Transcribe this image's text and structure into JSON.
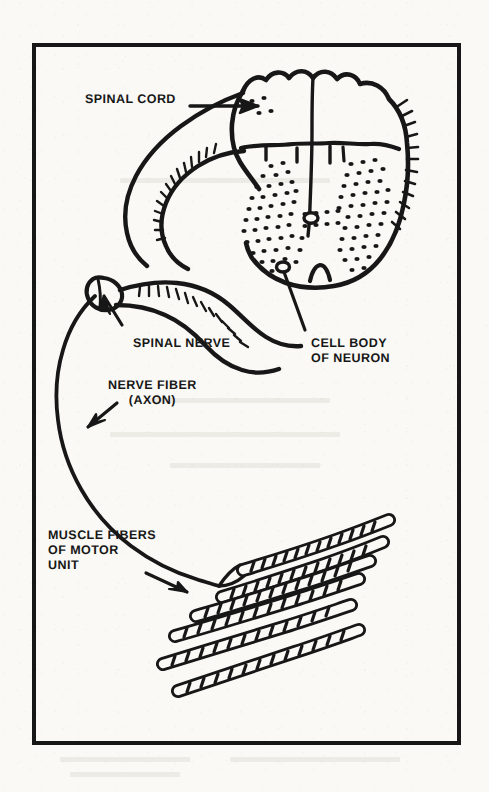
{
  "figure": {
    "background_color": "#faf9f6",
    "ink_color": "#171717",
    "frame": {
      "x": 32,
      "y": 43,
      "width": 429,
      "height": 702,
      "border_width": 4
    }
  },
  "labels": {
    "spinal_cord": {
      "text": "SPINAL CORD",
      "x": 85,
      "y": 92,
      "align": "left",
      "pointer": "arrow-right"
    },
    "spinal_nerve": {
      "text": "SPINAL NERVE",
      "x": 133,
      "y": 336,
      "align": "left",
      "pointer": "arrow-up-left"
    },
    "cell_body_of_neuron": {
      "line1": "CELL BODY",
      "line2": "OF NEURON",
      "text": "CELL BODY\nOF NEURON",
      "x": 311,
      "y": 336,
      "align": "left",
      "pointer": "leader-line-up-left"
    },
    "nerve_fiber_axon": {
      "line1": "NERVE FIBER",
      "line2": "(AXON)",
      "text": "NERVE FIBER\n(AXON)",
      "x": 108,
      "y": 378,
      "align": "center",
      "pointer": "arrow-down-left"
    },
    "muscle_fibers_of_motor_unit": {
      "line1": "MUSCLE FIBERS",
      "line2": "OF MOTOR",
      "line3": "UNIT",
      "text": "MUSCLE FIBERS\nOF MOTOR\nUNIT",
      "x": 48,
      "y": 528,
      "align": "left",
      "pointer": "arrow-down-right"
    }
  },
  "structures": [
    {
      "name": "spinal-cord-cross-section",
      "description": "Oval cross-section of spinal cord, upper right of frame"
    },
    {
      "name": "gray-matter-butterfly",
      "description": "Stippled butterfly/H-shaped gray matter inside the cord"
    },
    {
      "name": "central-canal",
      "description": "Small open oval at the centre of the gray matter"
    },
    {
      "name": "dorsal-root",
      "description": "Upper nerve root with bristle hatching looping left from the cord"
    },
    {
      "name": "ventral-root",
      "description": "Lower nerve root with bristle hatching leaving the cord"
    },
    {
      "name": "dorsal-root-ganglion",
      "description": "Small swelling where the roots merge at far left"
    },
    {
      "name": "spinal-nerve-trunk",
      "description": "Merged nerve leaving the ganglion"
    },
    {
      "name": "motor-axon",
      "description": "Long single fibre sweeping down and right to the muscle"
    },
    {
      "name": "muscle-fiber-bundle",
      "description": "Six striated muscle fibres fanning to the lower right"
    }
  ]
}
